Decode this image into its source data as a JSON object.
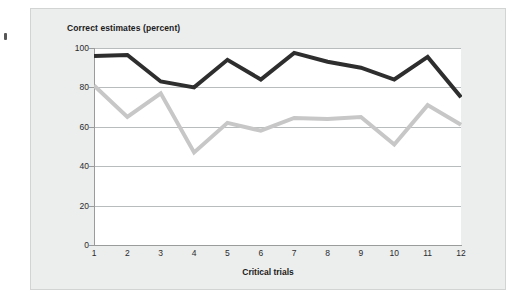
{
  "figure": {
    "title": "Correct estimates (percent)",
    "xaxis_title": "Critical trials",
    "panel_background": "#eceded",
    "plot_background": "#ffffff",
    "gridline_color": "#b9bcbc",
    "axis_color": "#9a9c9c"
  },
  "chart_data": {
    "type": "line",
    "title": "Correct estimates (percent)",
    "xlabel": "Critical trials",
    "ylabel": "Correct estimates (percent)",
    "categories": [
      "1",
      "2",
      "3",
      "4",
      "5",
      "6",
      "7",
      "8",
      "9",
      "10",
      "11",
      "12"
    ],
    "x": [
      1,
      2,
      3,
      4,
      5,
      6,
      7,
      8,
      9,
      10,
      11,
      12
    ],
    "xlim": [
      1,
      12
    ],
    "ylim": [
      0,
      100
    ],
    "yticks": [
      0,
      20,
      40,
      60,
      80,
      100
    ],
    "ytick_labels": [
      "0",
      "20",
      "40",
      "60",
      "80",
      "100"
    ],
    "grid": "horizontal",
    "legend": "none",
    "series": [
      {
        "name": "dark-series",
        "color": "#2e2e2e",
        "line_width": 4,
        "values": [
          96,
          96.5,
          83,
          80,
          94,
          84,
          97.5,
          93,
          90,
          84,
          95.5,
          75
        ]
      },
      {
        "name": "light-series",
        "color": "#c7c7c7",
        "line_width": 4,
        "values": [
          81,
          65,
          77,
          47,
          62,
          58,
          64.5,
          64,
          65,
          51,
          71,
          61
        ]
      }
    ]
  }
}
